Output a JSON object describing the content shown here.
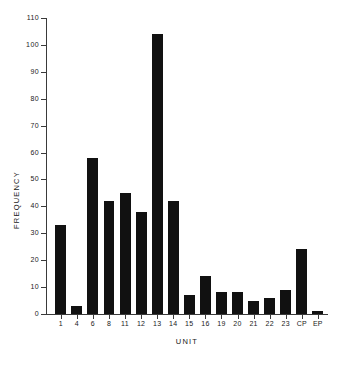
{
  "chart_data": {
    "type": "bar",
    "title": "",
    "xlabel": "UNIT",
    "ylabel": "FREQUENCY",
    "categories": [
      "1",
      "4",
      "6",
      "8",
      "11",
      "12",
      "13",
      "14",
      "15",
      "16",
      "19",
      "20",
      "21",
      "22",
      "23",
      "CP",
      "EP"
    ],
    "values": [
      33,
      3,
      58,
      42,
      45,
      38,
      104,
      42,
      7,
      14,
      8,
      8,
      5,
      6,
      9,
      24,
      1
    ],
    "ylim": [
      0,
      110
    ],
    "y_ticks": [
      0,
      10,
      20,
      30,
      40,
      50,
      60,
      70,
      80,
      90,
      100,
      110
    ],
    "y_tick_labels": [
      "0",
      "10",
      "20",
      "30",
      "40",
      "50",
      "60",
      "70",
      "80",
      "90",
      "100",
      "110"
    ],
    "grid": false,
    "legend": null,
    "bar_color": "#111111",
    "axis_color": "#3a3a3a",
    "background_color": "#ffffff"
  }
}
